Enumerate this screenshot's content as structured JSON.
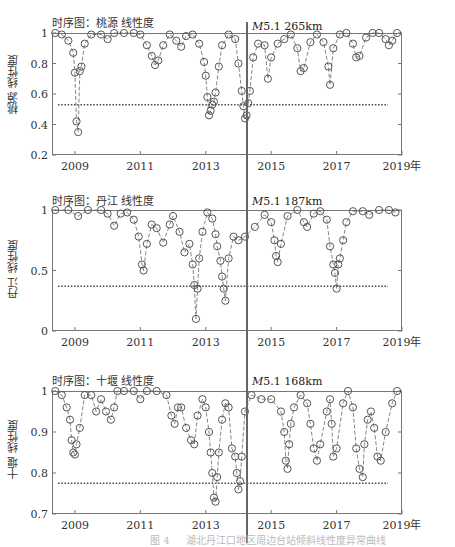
{
  "figure": {
    "earthquake_marker": {
      "year": 2014.0,
      "label_prefix": "M",
      "magnitude": "5.1"
    },
    "caption": "图 4 　 湖北丹江口地区周边台站倾斜线性度异常曲线"
  },
  "chart_data": [
    {
      "type": "scatter",
      "title": "时序图：桃源 线性度",
      "ylabel": "桃源 线性度",
      "xlabel": "年",
      "annotation": "M5.1 265km",
      "distance": "265km",
      "x_ticks": [
        "2009",
        "2011",
        "2013",
        "2015",
        "2017",
        "2019年"
      ],
      "y_ticks": [
        "0.2",
        "0.4",
        "0.6",
        "0.8",
        "1"
      ],
      "ylim": [
        0.2,
        1.0
      ],
      "xlim": [
        2008.3,
        2019.0
      ],
      "threshold": 0.53,
      "event_x": 2014.0,
      "series": [
        {
          "name": "线性度",
          "x": [
            2008.4,
            2008.6,
            2008.8,
            2008.95,
            2009.0,
            2009.05,
            2009.1,
            2009.15,
            2009.2,
            2009.3,
            2009.5,
            2009.8,
            2010.0,
            2010.2,
            2010.5,
            2010.8,
            2011.0,
            2011.2,
            2011.35,
            2011.45,
            2011.55,
            2011.7,
            2011.9,
            2012.1,
            2012.25,
            2012.4,
            2012.6,
            2012.8,
            2012.95,
            2013.0,
            2013.05,
            2013.1,
            2013.15,
            2013.2,
            2013.25,
            2013.3,
            2013.4,
            2013.5,
            2013.7,
            2013.9,
            2014.0,
            2014.1,
            2014.15,
            2014.2,
            2014.25,
            2014.3,
            2014.35,
            2014.45,
            2014.6,
            2014.8,
            2014.9,
            2015.0,
            2015.2,
            2015.4,
            2015.6,
            2015.8,
            2015.9,
            2016.0,
            2016.2,
            2016.4,
            2016.6,
            2016.75,
            2016.8,
            2016.9,
            2017.1,
            2017.3,
            2017.5,
            2017.6,
            2017.7,
            2017.9,
            2018.1,
            2018.3,
            2018.5,
            2018.6,
            2018.7,
            2018.85
          ],
          "values": [
            1.0,
            0.99,
            0.95,
            0.87,
            0.74,
            0.42,
            0.35,
            0.75,
            0.78,
            0.93,
            0.99,
            0.99,
            0.96,
            1.0,
            1.0,
            1.0,
            0.99,
            0.92,
            0.85,
            0.79,
            0.82,
            0.92,
            0.99,
            0.95,
            0.91,
            0.98,
            0.99,
            0.93,
            0.81,
            0.72,
            0.58,
            0.46,
            0.49,
            0.53,
            0.55,
            0.61,
            0.78,
            0.92,
            0.99,
            0.96,
            0.8,
            0.62,
            0.52,
            0.44,
            0.46,
            0.54,
            0.62,
            0.84,
            0.93,
            0.92,
            0.7,
            0.84,
            0.93,
            0.96,
            0.99,
            0.9,
            0.75,
            0.77,
            0.94,
            0.99,
            0.94,
            0.78,
            0.66,
            0.9,
            0.99,
            1.0,
            0.93,
            0.84,
            0.85,
            0.97,
            1.0,
            1.0,
            0.96,
            0.92,
            0.95,
            1.0
          ]
        }
      ]
    },
    {
      "type": "scatter",
      "title": "时序图：丹江 线性度",
      "ylabel": "丹江 线性度",
      "xlabel": "年",
      "annotation": "M5.1 187km",
      "distance": "187km",
      "x_ticks": [
        "2009",
        "2011",
        "2013",
        "2015",
        "2017",
        "2019年"
      ],
      "y_ticks": [
        "0",
        "0.5",
        "1"
      ],
      "ylim": [
        0.0,
        1.0
      ],
      "xlim": [
        2008.3,
        2019.0
      ],
      "threshold": 0.37,
      "event_x": 2014.0,
      "series": [
        {
          "name": "线性度",
          "x": [
            2008.4,
            2008.8,
            2009.1,
            2009.4,
            2009.8,
            2010.0,
            2010.2,
            2010.4,
            2010.6,
            2010.8,
            2010.95,
            2011.05,
            2011.1,
            2011.2,
            2011.35,
            2011.5,
            2011.7,
            2011.9,
            2012.0,
            2012.2,
            2012.35,
            2012.5,
            2012.6,
            2012.65,
            2012.7,
            2012.75,
            2012.8,
            2012.9,
            2013.05,
            2013.2,
            2013.3,
            2013.35,
            2013.45,
            2013.5,
            2013.55,
            2013.6,
            2013.7,
            2013.85,
            2014.0,
            2014.2,
            2014.5,
            2014.8,
            2015.0,
            2015.1,
            2015.15,
            2015.2,
            2015.3,
            2015.5,
            2015.8,
            2016.0,
            2016.1,
            2016.3,
            2016.5,
            2016.7,
            2016.8,
            2016.9,
            2016.95,
            2017.0,
            2017.05,
            2017.1,
            2017.2,
            2017.3,
            2017.5,
            2017.8,
            2018.0,
            2018.3,
            2018.6,
            2018.8
          ],
          "values": [
            1.0,
            1.0,
            0.95,
            1.0,
            1.0,
            0.97,
            0.87,
            0.97,
            0.98,
            0.92,
            0.78,
            0.55,
            0.5,
            0.72,
            0.88,
            0.85,
            0.73,
            0.88,
            0.95,
            0.82,
            0.65,
            0.72,
            0.55,
            0.38,
            0.1,
            0.35,
            0.6,
            0.82,
            0.98,
            0.93,
            0.8,
            0.7,
            0.58,
            0.45,
            0.35,
            0.25,
            0.6,
            0.78,
            0.75,
            0.78,
            0.86,
            0.96,
            0.9,
            0.75,
            0.62,
            0.57,
            0.72,
            0.95,
            1.0,
            0.9,
            0.86,
            0.97,
            0.99,
            0.92,
            0.7,
            0.55,
            0.48,
            0.35,
            0.55,
            0.6,
            0.75,
            0.9,
            0.99,
            0.99,
            0.96,
            1.0,
            1.0,
            0.98
          ]
        }
      ]
    },
    {
      "type": "scatter",
      "title": "时序图：十堰 线性度",
      "ylabel": "十堰 线性度",
      "xlabel": "年",
      "annotation": "M5.1 168km",
      "distance": "168km",
      "x_ticks": [
        "2009",
        "2011",
        "2013",
        "2015",
        "2017",
        "2019年"
      ],
      "y_ticks": [
        "0.7",
        "0.8",
        "0.9",
        "1"
      ],
      "ylim": [
        0.7,
        1.0
      ],
      "xlim": [
        2008.3,
        2019.0
      ],
      "threshold": 0.775,
      "event_x": 2014.0,
      "series": [
        {
          "name": "线性度",
          "x": [
            2008.4,
            2008.6,
            2008.75,
            2008.85,
            2008.9,
            2008.95,
            2009.0,
            2009.05,
            2009.15,
            2009.3,
            2009.5,
            2009.65,
            2009.8,
            2009.95,
            2010.1,
            2010.2,
            2010.3,
            2010.5,
            2010.8,
            2011.0,
            2011.2,
            2011.5,
            2011.8,
            2011.95,
            2012.05,
            2012.15,
            2012.25,
            2012.4,
            2012.55,
            2012.65,
            2012.75,
            2012.9,
            2013.0,
            2013.1,
            2013.15,
            2013.2,
            2013.25,
            2013.3,
            2013.35,
            2013.4,
            2013.5,
            2013.6,
            2013.7,
            2013.8,
            2013.9,
            2013.95,
            2014.0,
            2014.05,
            2014.1,
            2014.2,
            2014.4,
            2014.7,
            2015.0,
            2015.3,
            2015.4,
            2015.45,
            2015.5,
            2015.55,
            2015.6,
            2015.7,
            2015.9,
            2016.1,
            2016.2,
            2016.3,
            2016.4,
            2016.5,
            2016.7,
            2016.8,
            2016.85,
            2016.9,
            2017.0,
            2017.2,
            2017.35,
            2017.5,
            2017.6,
            2017.7,
            2017.8,
            2017.85,
            2017.95,
            2018.05,
            2018.15,
            2018.25,
            2018.35,
            2018.5,
            2018.7,
            2018.85
          ],
          "values": [
            1.0,
            0.99,
            0.96,
            0.93,
            0.88,
            0.85,
            0.845,
            0.87,
            0.91,
            0.99,
            0.99,
            0.95,
            0.98,
            0.95,
            0.93,
            0.96,
            1.0,
            1.0,
            1.0,
            0.98,
            1.0,
            1.0,
            0.99,
            0.94,
            0.92,
            0.96,
            0.96,
            0.91,
            0.88,
            0.87,
            0.94,
            0.98,
            0.96,
            0.9,
            0.85,
            0.8,
            0.74,
            0.73,
            0.79,
            0.85,
            0.93,
            0.97,
            0.96,
            0.86,
            0.84,
            0.8,
            0.76,
            0.78,
            0.84,
            0.95,
            0.99,
            0.98,
            0.98,
            0.95,
            0.9,
            0.83,
            0.81,
            0.87,
            0.92,
            0.96,
            0.99,
            0.97,
            0.92,
            0.86,
            0.83,
            0.87,
            0.95,
            0.98,
            0.92,
            0.84,
            0.86,
            0.97,
            1.0,
            0.96,
            0.86,
            0.81,
            0.79,
            0.87,
            0.93,
            0.95,
            0.91,
            0.84,
            0.83,
            0.9,
            0.97,
            1.0
          ]
        }
      ]
    }
  ]
}
